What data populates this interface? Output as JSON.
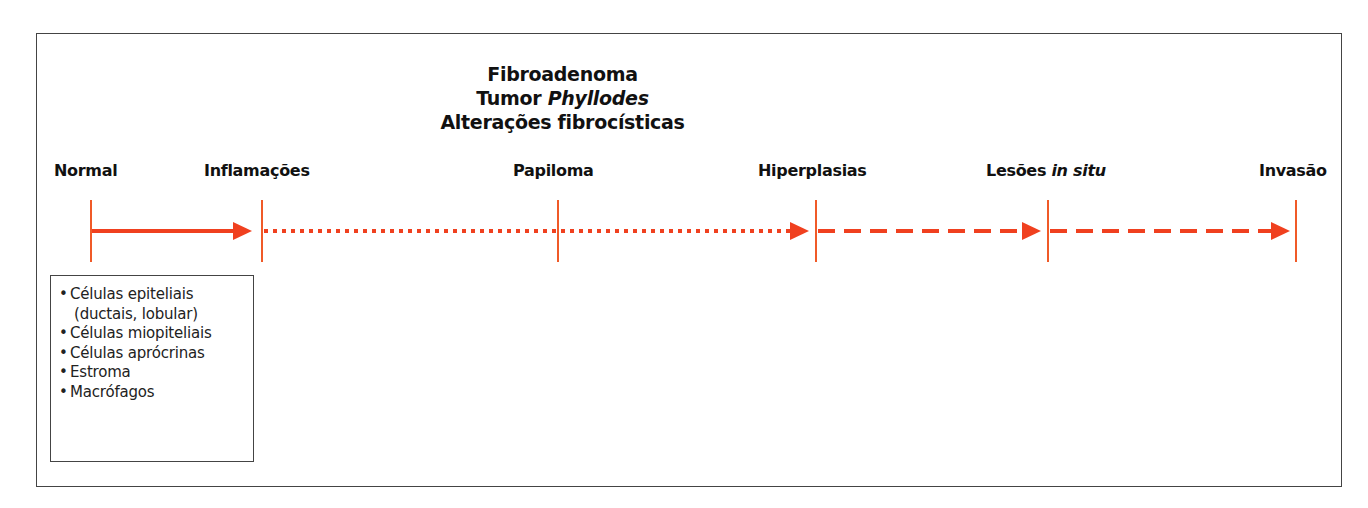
{
  "diagram": {
    "colors": {
      "arrow": "#f0401f",
      "tick": "#f05a28",
      "frame": "#444444",
      "text": "#111111"
    },
    "group_header": {
      "lines": [
        {
          "plain": "Fibroadenoma",
          "italic": ""
        },
        {
          "plain": "Tumor ",
          "italic": "Phyllodes"
        },
        {
          "plain": "Alterações fibrocísticas",
          "italic": ""
        }
      ]
    },
    "stages": [
      {
        "label": "Normal",
        "italic": "",
        "x": 91,
        "style_to_next": "solid"
      },
      {
        "label": "Inflamações",
        "italic": "",
        "x": 262,
        "style_to_next": "dotted"
      },
      {
        "label": "Papiloma",
        "italic": "",
        "x": 558,
        "style_to_next": "dotted"
      },
      {
        "label": "Hiperplasias",
        "italic": "",
        "x": 816,
        "style_to_next": "dashed"
      },
      {
        "label": "Lesões ",
        "italic": "in situ",
        "x": 1048,
        "style_to_next": "dashed"
      },
      {
        "label": "Invasão",
        "italic": "",
        "x": 1296,
        "style_to_next": ""
      }
    ],
    "legend": {
      "items": [
        {
          "text": "Células epiteliais",
          "sub": "(ductais, lobular)"
        },
        {
          "text": "Células miopiteliais",
          "sub": ""
        },
        {
          "text": "Células aprócrinas",
          "sub": ""
        },
        {
          "text": "Estroma",
          "sub": ""
        },
        {
          "text": "Macrófagos",
          "sub": ""
        }
      ]
    }
  }
}
